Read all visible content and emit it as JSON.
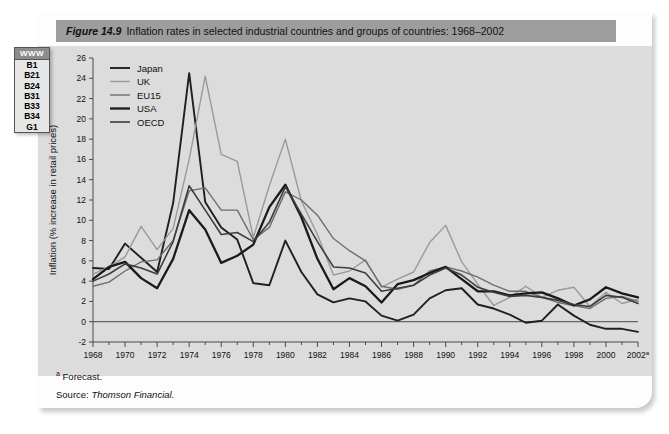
{
  "figure": {
    "number": "Figure 14.9",
    "title": "Inflation rates in selected industrial countries and groups of countries: 1968–2002"
  },
  "margin_tab": {
    "header": "WWW",
    "items": [
      "B1",
      "B21",
      "B24",
      "B31",
      "B33",
      "B34",
      "G1"
    ]
  },
  "footnotes": {
    "marker": "a",
    "forecast": "Forecast.",
    "source_label": "Source:",
    "source_name": "Thomson Financial."
  },
  "chart_data": {
    "type": "line",
    "title": "Inflation rates in selected industrial countries and groups of countries: 1968–2002",
    "xlabel": "",
    "ylabel": "Inflation (% increase in retail prices)",
    "xlim": [
      1968,
      2002
    ],
    "ylim": [
      -2,
      26
    ],
    "ytick_step": 2,
    "xtick_step": 2,
    "grid": false,
    "legend_position": "top-left",
    "x": [
      1968,
      1969,
      1970,
      1971,
      1972,
      1973,
      1974,
      1975,
      1976,
      1977,
      1978,
      1979,
      1980,
      1981,
      1982,
      1983,
      1984,
      1985,
      1986,
      1987,
      1988,
      1989,
      1990,
      1991,
      1992,
      1993,
      1994,
      1995,
      1996,
      1997,
      1998,
      1999,
      2000,
      2001,
      2002
    ],
    "xtick_labels": [
      "1968",
      "1970",
      "1972",
      "1974",
      "1976",
      "1978",
      "1980",
      "1982",
      "1984",
      "1986",
      "1988",
      "1990",
      "1992",
      "1994",
      "1996",
      "1998",
      "2000",
      "2002"
    ],
    "ytick_labels": [
      "-2",
      "0",
      "2",
      "4",
      "6",
      "8",
      "10",
      "12",
      "14",
      "16",
      "18",
      "20",
      "22",
      "24",
      "26"
    ],
    "last_tick_superscript": "a",
    "series": [
      {
        "name": "Japan",
        "color": "#1f1f1f",
        "width": 1.9,
        "values": [
          5.3,
          5.2,
          7.7,
          6.3,
          4.9,
          11.7,
          24.5,
          11.8,
          9.3,
          8.1,
          3.8,
          3.6,
          8.0,
          4.9,
          2.7,
          1.9,
          2.3,
          2.0,
          0.6,
          0.1,
          0.7,
          2.3,
          3.1,
          3.3,
          1.7,
          1.3,
          0.7,
          -0.1,
          0.1,
          1.7,
          0.6,
          -0.3,
          -0.7,
          -0.7,
          -1.0
        ]
      },
      {
        "name": "UK",
        "color": "#9a9a9a",
        "width": 1.4,
        "values": [
          4.7,
          5.4,
          6.4,
          9.4,
          7.1,
          9.2,
          16.0,
          24.2,
          16.5,
          15.8,
          8.3,
          13.4,
          18.0,
          11.9,
          8.6,
          4.6,
          5.0,
          6.1,
          3.4,
          4.2,
          4.9,
          7.8,
          9.5,
          5.9,
          3.7,
          1.6,
          2.4,
          3.5,
          2.4,
          3.1,
          3.4,
          1.5,
          2.9,
          1.8,
          2.2
        ]
      },
      {
        "name": "EU15",
        "color": "#6e6e6e",
        "width": 1.4,
        "values": [
          3.5,
          3.9,
          5.0,
          5.9,
          6.1,
          8.0,
          12.9,
          13.2,
          11.0,
          11.0,
          8.1,
          9.3,
          12.8,
          12.0,
          10.5,
          8.2,
          7.0,
          6.0,
          3.5,
          3.2,
          3.6,
          5.0,
          5.4,
          5.0,
          4.4,
          3.6,
          3.0,
          3.0,
          2.4,
          1.9,
          1.6,
          1.3,
          2.3,
          2.5,
          2.0
        ]
      },
      {
        "name": "USA",
        "color": "#1a1a1a",
        "width": 2.3,
        "values": [
          4.2,
          5.4,
          5.9,
          4.3,
          3.3,
          6.2,
          11.0,
          9.1,
          5.8,
          6.5,
          7.6,
          11.3,
          13.5,
          10.3,
          6.2,
          3.2,
          4.3,
          3.5,
          1.9,
          3.7,
          4.1,
          4.8,
          5.4,
          4.2,
          3.0,
          3.0,
          2.6,
          2.8,
          2.9,
          2.3,
          1.6,
          2.2,
          3.4,
          2.8,
          2.4
        ]
      },
      {
        "name": "OECD",
        "color": "#3d3d3d",
        "width": 1.6,
        "values": [
          4.0,
          4.7,
          5.7,
          5.3,
          4.7,
          7.9,
          13.4,
          11.0,
          8.6,
          8.8,
          7.9,
          9.8,
          13.3,
          10.6,
          7.9,
          5.4,
          5.3,
          4.8,
          3.0,
          3.3,
          3.6,
          4.6,
          5.3,
          4.6,
          3.4,
          2.9,
          2.5,
          2.6,
          2.4,
          2.1,
          1.7,
          1.5,
          2.6,
          2.4,
          1.8
        ]
      }
    ]
  }
}
